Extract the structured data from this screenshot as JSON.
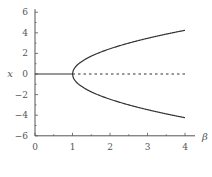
{
  "chart_data": {
    "type": "line",
    "title": "",
    "xlabel": "β",
    "ylabel": "x",
    "xlim": [
      0,
      4
    ],
    "ylim": [
      -6,
      6
    ],
    "grid": false,
    "legend": null,
    "x_ticks": [
      "0",
      "1",
      "2",
      "3",
      "4"
    ],
    "y_ticks": [
      "6",
      "4",
      "2",
      "0",
      "-2",
      "-4",
      "-6"
    ],
    "series": [
      {
        "name": "stable zero branch",
        "style": "solid",
        "x": [
          0,
          1
        ],
        "y": [
          0,
          0
        ]
      },
      {
        "name": "unstable zero branch",
        "style": "dashed",
        "x": [
          1,
          4
        ],
        "y": [
          0,
          0
        ]
      },
      {
        "name": "upper branch",
        "style": "solid",
        "x": [
          1,
          1.05,
          1.2,
          1.5,
          2,
          2.5,
          3,
          3.5,
          4
        ],
        "y": [
          0,
          0.55,
          1.1,
          1.73,
          2.45,
          3.0,
          3.46,
          3.87,
          4.24
        ]
      },
      {
        "name": "lower branch",
        "style": "solid",
        "x": [
          1,
          1.05,
          1.2,
          1.5,
          2,
          2.5,
          3,
          3.5,
          4
        ],
        "y": [
          0,
          -0.55,
          -1.1,
          -1.73,
          -2.45,
          -3.0,
          -3.46,
          -3.87,
          -4.24
        ]
      }
    ]
  }
}
